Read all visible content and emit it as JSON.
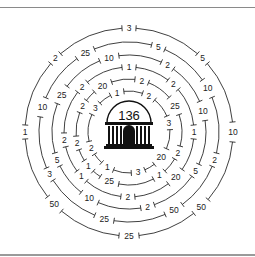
{
  "diagram": {
    "type": "concentric-ring-number-puzzle",
    "center": {
      "icon": "temple-building-icon",
      "target_value": "136"
    },
    "rings": [
      {
        "name": "ring-1",
        "radius": 104,
        "labels": [
          {
            "value": "3",
            "angle": 0
          },
          {
            "value": "5",
            "angle": 45
          },
          {
            "value": "10",
            "angle": 90
          },
          {
            "value": "50",
            "angle": 136
          },
          {
            "value": "25",
            "angle": 180
          },
          {
            "value": "50",
            "angle": 226
          },
          {
            "value": "1",
            "angle": 270
          },
          {
            "value": "2",
            "angle": 315
          }
        ]
      },
      {
        "name": "ring-2",
        "radius": 90,
        "labels": [
          {
            "value": "5",
            "angle": 19
          },
          {
            "value": "10",
            "angle": 61
          },
          {
            "value": "2",
            "angle": 108
          },
          {
            "value": "50",
            "angle": 150
          },
          {
            "value": "25",
            "angle": 196
          },
          {
            "value": "3",
            "angle": 242
          },
          {
            "value": "10",
            "angle": 286
          },
          {
            "value": "25",
            "angle": 331
          }
        ]
      },
      {
        "name": "ring-3",
        "radius": 77,
        "labels": [
          {
            "value": "2",
            "angle": 30
          },
          {
            "value": "10",
            "angle": 74
          },
          {
            "value": "5",
            "angle": 120
          },
          {
            "value": "2",
            "angle": 166
          },
          {
            "value": "10",
            "angle": 211
          },
          {
            "value": "5",
            "angle": 249
          },
          {
            "value": "25",
            "angle": 299
          },
          {
            "value": "10",
            "angle": 345
          }
        ]
      },
      {
        "name": "ring-4",
        "radius": 65,
        "labels": [
          {
            "value": "1",
            "angle": 0
          },
          {
            "value": "2",
            "angle": 43
          },
          {
            "value": "1",
            "angle": 90
          },
          {
            "value": "20",
            "angle": 134
          },
          {
            "value": "2",
            "angle": 181
          },
          {
            "value": "1",
            "angle": 227
          },
          {
            "value": "2",
            "angle": 263
          },
          {
            "value": "2",
            "angle": 314
          }
        ]
      },
      {
        "name": "ring-5",
        "radius": 53,
        "labels": [
          {
            "value": "2",
            "angle": 14
          },
          {
            "value": "25",
            "angle": 60
          },
          {
            "value": "2",
            "angle": 113
          },
          {
            "value": "1",
            "angle": 145
          },
          {
            "value": "25",
            "angle": 202
          },
          {
            "value": "1",
            "angle": 230
          },
          {
            "value": "2",
            "angle": 258
          },
          {
            "value": "2",
            "angle": 299
          },
          {
            "value": "20",
            "angle": 330
          }
        ]
      },
      {
        "name": "ring-6",
        "radius": 41,
        "labels": [
          {
            "value": "2",
            "angle": 29
          },
          {
            "value": "3",
            "angle": 77
          },
          {
            "value": "20",
            "angle": 128
          },
          {
            "value": "3",
            "angle": 167
          },
          {
            "value": "1",
            "angle": 212
          },
          {
            "value": "2",
            "angle": 247
          },
          {
            "value": "3",
            "angle": 305
          },
          {
            "value": "1",
            "angle": 343
          }
        ]
      }
    ]
  }
}
